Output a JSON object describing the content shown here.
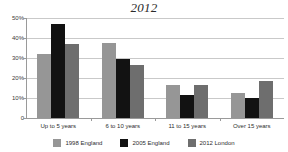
{
  "chart_data": {
    "type": "bar",
    "title": "2012",
    "xlabel": "",
    "ylabel": "",
    "ylim": [
      0,
      50
    ],
    "yticks": [
      0,
      10,
      20,
      30,
      40,
      50
    ],
    "ytick_labels": [
      "0",
      "10%",
      "20%",
      "30%",
      "40%",
      "50%"
    ],
    "grid": true,
    "legend_position": "bottom",
    "categories": [
      "Up to 5 years",
      "6 to 10 years",
      "11 to 15 years",
      "Over 15 years"
    ],
    "series": [
      {
        "name": "1998 England",
        "color": "#969696",
        "values": [
          32,
          37.5,
          16.5,
          12.5
        ]
      },
      {
        "name": "2005 England",
        "color": "#121212",
        "values": [
          47,
          29.5,
          11.5,
          10
        ]
      },
      {
        "name": "2012 London",
        "color": "#6e6e6e",
        "values": [
          37,
          26.5,
          16.5,
          18.5
        ]
      }
    ]
  }
}
